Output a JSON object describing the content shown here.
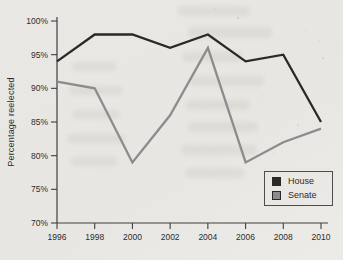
{
  "chart_data": {
    "type": "line",
    "x": [
      "1996",
      "1998",
      "2000",
      "2002",
      "2004",
      "2006",
      "2008",
      "2010"
    ],
    "series": [
      {
        "name": "House",
        "color": "#2b2829",
        "values": [
          94,
          98,
          98,
          96,
          98,
          94,
          95,
          85
        ]
      },
      {
        "name": "Senate",
        "color": "#8c8c8e",
        "values": [
          91,
          90,
          79,
          86,
          96,
          79,
          82,
          84
        ]
      }
    ],
    "title": "",
    "xlabel": "",
    "ylabel": "Percentage reelected",
    "ylim": [
      70,
      100
    ],
    "yticks": [
      70,
      75,
      80,
      85,
      90,
      95,
      100
    ],
    "ytick_labels": [
      "70%",
      "75%",
      "80%",
      "85%",
      "90%",
      "95%",
      "100%"
    ],
    "grid": false,
    "legend_position": "bottom-right"
  },
  "colors": {
    "background": "#e9e7e3",
    "axis": "#3f3e40",
    "tick_text": "#2e2c2d"
  }
}
